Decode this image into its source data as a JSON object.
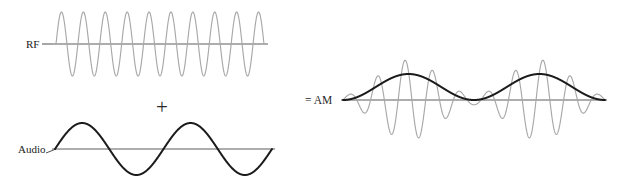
{
  "figure": {
    "background_color": "#ffffff",
    "width": 622,
    "height": 185
  },
  "colors": {
    "carrier_gray": "#a8a8a8",
    "signal_dark": "#1b1b1b",
    "axis_gray": "#4a4a4a",
    "text_dark": "#1b1b1b"
  },
  "labels": {
    "rf": "RF",
    "audio": "Audio",
    "plus": "+",
    "equals_am": "= AM"
  },
  "panels": {
    "rf": {
      "label": "RF",
      "label_x": 26,
      "label_y": 48,
      "axis_y": 44,
      "axis_x0": 52,
      "axis_x1": 268,
      "wave_x0": 56,
      "wave_x1": 264,
      "amplitude": 32,
      "cycles": 9.5,
      "phase": 0,
      "stroke": "#a8a8a8"
    },
    "audio": {
      "label": "Audio",
      "label_x": 18,
      "label_y": 153,
      "axis_y": 149,
      "axis_x0": 52,
      "axis_x1": 275,
      "wave_x0": 55,
      "wave_x1": 272,
      "amplitude": 26,
      "cycles": 2,
      "phase": 0,
      "stroke": "#1b1b1b"
    },
    "am": {
      "label": "= AM",
      "label_x": 305,
      "label_y": 104,
      "axis_y": 100,
      "axis_x0": 341,
      "axis_x1": 607,
      "wave_x0": 343,
      "wave_x1": 605,
      "carrier_cycles": 9.5,
      "envelope_cycles": 2,
      "carrier_amplitude": 40,
      "envelope_amplitude": 26,
      "modulation_index": 1,
      "carrier_stroke": "#a8a8a8",
      "envelope_stroke": "#1b1b1b"
    }
  },
  "operators": {
    "plus": {
      "text": "+",
      "x": 162,
      "y": 114
    },
    "equals_am": {
      "text": "= AM",
      "x": 305,
      "y": 104
    }
  }
}
